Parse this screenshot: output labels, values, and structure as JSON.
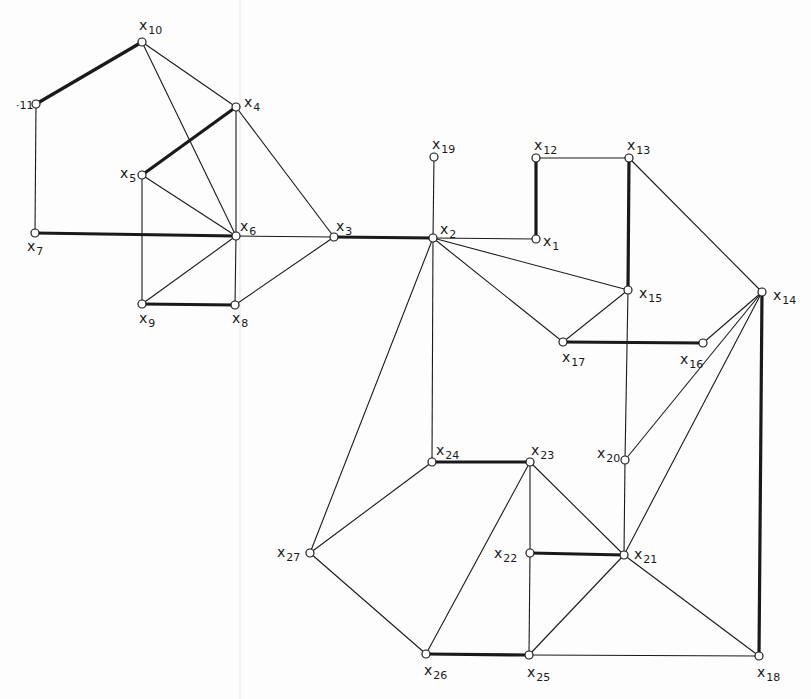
{
  "diagram": {
    "type": "graph",
    "nodes": [
      {
        "id": "x1",
        "label": "x",
        "sub": "1",
        "x": 536,
        "y": 239,
        "lx": 543,
        "ly": 246
      },
      {
        "id": "x2",
        "label": "x",
        "sub": "2",
        "x": 433,
        "y": 238,
        "lx": 440,
        "ly": 234
      },
      {
        "id": "x3",
        "label": "x",
        "sub": "3",
        "x": 334,
        "y": 237,
        "lx": 336,
        "ly": 231
      },
      {
        "id": "x4",
        "label": "x",
        "sub": "4",
        "x": 236,
        "y": 107,
        "lx": 244,
        "ly": 107
      },
      {
        "id": "x5",
        "label": "x",
        "sub": "5",
        "x": 142,
        "y": 175,
        "lx": 120,
        "ly": 178
      },
      {
        "id": "x6",
        "label": "x",
        "sub": "6",
        "x": 236,
        "y": 236,
        "lx": 240,
        "ly": 231
      },
      {
        "id": "x7",
        "label": "x",
        "sub": "7",
        "x": 35,
        "y": 233,
        "lx": 27,
        "ly": 251
      },
      {
        "id": "x8",
        "label": "x",
        "sub": "8",
        "x": 235,
        "y": 305,
        "lx": 232,
        "ly": 323
      },
      {
        "id": "x9",
        "label": "x",
        "sub": "9",
        "x": 142,
        "y": 304,
        "lx": 139,
        "ly": 323
      },
      {
        "id": "x10",
        "label": "x",
        "sub": "10",
        "x": 142,
        "y": 42,
        "lx": 139,
        "ly": 30
      },
      {
        "id": "x11",
        "label": "",
        "sub": "11",
        "x": 36,
        "y": 104,
        "lx": 16,
        "ly": 109
      },
      {
        "id": "x12",
        "label": "x",
        "sub": "12",
        "x": 536,
        "y": 158,
        "lx": 534,
        "ly": 150
      },
      {
        "id": "x13",
        "label": "x",
        "sub": "13",
        "x": 629,
        "y": 158,
        "lx": 627,
        "ly": 150
      },
      {
        "id": "x14",
        "label": "x",
        "sub": "14",
        "x": 762,
        "y": 292,
        "lx": 773,
        "ly": 300
      },
      {
        "id": "x15",
        "label": "x",
        "sub": "15",
        "x": 628,
        "y": 290,
        "lx": 639,
        "ly": 298
      },
      {
        "id": "x16",
        "label": "x",
        "sub": "16",
        "x": 703,
        "y": 343,
        "lx": 680,
        "ly": 364
      },
      {
        "id": "x17",
        "label": "x",
        "sub": "17",
        "x": 563,
        "y": 342,
        "lx": 562,
        "ly": 362
      },
      {
        "id": "x18",
        "label": "x",
        "sub": "18",
        "x": 759,
        "y": 656,
        "lx": 757,
        "ly": 677
      },
      {
        "id": "x19",
        "label": "x",
        "sub": "19",
        "x": 434,
        "y": 157,
        "lx": 432,
        "ly": 149
      },
      {
        "id": "x20",
        "label": "x",
        "sub": "20",
        "x": 625,
        "y": 460,
        "lx": 597,
        "ly": 458
      },
      {
        "id": "x21",
        "label": "x",
        "sub": "21",
        "x": 624,
        "y": 555,
        "lx": 634,
        "ly": 559
      },
      {
        "id": "x22",
        "label": "x",
        "sub": "22",
        "x": 530,
        "y": 553,
        "lx": 494,
        "ly": 558
      },
      {
        "id": "x23",
        "label": "x",
        "sub": "23",
        "x": 530,
        "y": 462,
        "lx": 531,
        "ly": 455
      },
      {
        "id": "x24",
        "label": "x",
        "sub": "24",
        "x": 432,
        "y": 462,
        "lx": 436,
        "ly": 455
      },
      {
        "id": "x25",
        "label": "x",
        "sub": "25",
        "x": 529,
        "y": 655,
        "lx": 527,
        "ly": 677
      },
      {
        "id": "x26",
        "label": "x",
        "sub": "26",
        "x": 426,
        "y": 654,
        "lx": 424,
        "ly": 675
      },
      {
        "id": "x27",
        "label": "x",
        "sub": "27",
        "x": 310,
        "y": 553,
        "lx": 277,
        "ly": 557
      }
    ],
    "edges": [
      {
        "from": "x10",
        "to": "x11",
        "bold": true
      },
      {
        "from": "x10",
        "to": "x4",
        "bold": false
      },
      {
        "from": "x10",
        "to": "x6",
        "bold": false
      },
      {
        "from": "x11",
        "to": "x7",
        "bold": false
      },
      {
        "from": "x4",
        "to": "x5",
        "bold": true
      },
      {
        "from": "x4",
        "to": "x6",
        "bold": false
      },
      {
        "from": "x4",
        "to": "x3",
        "bold": false
      },
      {
        "from": "x5",
        "to": "x6",
        "bold": false
      },
      {
        "from": "x5",
        "to": "x9",
        "bold": false
      },
      {
        "from": "x7",
        "to": "x6",
        "bold": true
      },
      {
        "from": "x6",
        "to": "x3",
        "bold": false
      },
      {
        "from": "x6",
        "to": "x9",
        "bold": false
      },
      {
        "from": "x6",
        "to": "x8",
        "bold": false
      },
      {
        "from": "x9",
        "to": "x8",
        "bold": true
      },
      {
        "from": "x8",
        "to": "x3",
        "bold": false
      },
      {
        "from": "x3",
        "to": "x2",
        "bold": true
      },
      {
        "from": "x2",
        "to": "x19",
        "bold": false
      },
      {
        "from": "x2",
        "to": "x1",
        "bold": false
      },
      {
        "from": "x2",
        "to": "x15",
        "bold": false
      },
      {
        "from": "x2",
        "to": "x17",
        "bold": false
      },
      {
        "from": "x2",
        "to": "x24",
        "bold": false
      },
      {
        "from": "x2",
        "to": "x27",
        "bold": false
      },
      {
        "from": "x1",
        "to": "x12",
        "bold": true
      },
      {
        "from": "x12",
        "to": "x13",
        "bold": false
      },
      {
        "from": "x13",
        "to": "x15",
        "bold": true
      },
      {
        "from": "x13",
        "to": "x14",
        "bold": false
      },
      {
        "from": "x15",
        "to": "x17",
        "bold": false
      },
      {
        "from": "x15",
        "to": "x20",
        "bold": false
      },
      {
        "from": "x17",
        "to": "x16",
        "bold": true
      },
      {
        "from": "x14",
        "to": "x16",
        "bold": false
      },
      {
        "from": "x14",
        "to": "x20",
        "bold": false
      },
      {
        "from": "x14",
        "to": "x21",
        "bold": false
      },
      {
        "from": "x14",
        "to": "x18",
        "bold": true
      },
      {
        "from": "x20",
        "to": "x21",
        "bold": false
      },
      {
        "from": "x24",
        "to": "x23",
        "bold": true
      },
      {
        "from": "x24",
        "to": "x27",
        "bold": false
      },
      {
        "from": "x23",
        "to": "x22",
        "bold": false
      },
      {
        "from": "x23",
        "to": "x21",
        "bold": false
      },
      {
        "from": "x23",
        "to": "x26",
        "bold": false
      },
      {
        "from": "x22",
        "to": "x21",
        "bold": true
      },
      {
        "from": "x22",
        "to": "x25",
        "bold": false
      },
      {
        "from": "x21",
        "to": "x25",
        "bold": false
      },
      {
        "from": "x21",
        "to": "x18",
        "bold": false
      },
      {
        "from": "x27",
        "to": "x26",
        "bold": false
      },
      {
        "from": "x26",
        "to": "x25",
        "bold": true
      },
      {
        "from": "x25",
        "to": "x18",
        "bold": false
      }
    ]
  }
}
